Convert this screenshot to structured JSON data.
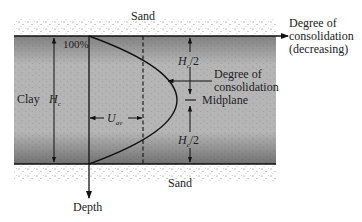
{
  "labels": {
    "sand_top": "Sand",
    "sand_bottom": "Sand",
    "clay": "Clay",
    "hc_symbol": "H",
    "hc_sub": "c",
    "percent_100": "100%",
    "uav_symbol": "U",
    "uav_sub": "av",
    "hc_half_top": "/2",
    "hc_half_bottom": "/2",
    "degree_consolidation_line1": "Degree of",
    "degree_consolidation_line2": "consolidation",
    "midplane": "Midplane",
    "axis_x_line1": "Degree of",
    "axis_x_line2": "consolidation",
    "axis_x_line3": "(decreasing)",
    "axis_y": "Depth"
  },
  "colors": {
    "clay_fill": "#b4b4b4",
    "sand_dots": "#555555",
    "line": "#111111"
  }
}
